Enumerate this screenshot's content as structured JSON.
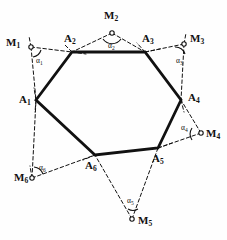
{
  "figure": {
    "type": "geometry-diagram",
    "background_color": "#fefefe",
    "ink_color": "#111111",
    "hexagon": {
      "stroke_width": 2.6,
      "style": "solid",
      "vertices": [
        {
          "label": "A",
          "sub": "1",
          "x": 36,
          "y": 100
        },
        {
          "label": "A",
          "sub": "2",
          "x": 72,
          "y": 52
        },
        {
          "label": "A",
          "sub": "3",
          "x": 145,
          "y": 52
        },
        {
          "label": "A",
          "sub": "4",
          "x": 181,
          "y": 100
        },
        {
          "label": "A",
          "sub": "5",
          "x": 158,
          "y": 148
        },
        {
          "label": "A",
          "sub": "6",
          "x": 95,
          "y": 155
        }
      ]
    },
    "external_points": [
      {
        "label": "M",
        "sub": "1",
        "x": 26,
        "y": 45
      },
      {
        "label": "M",
        "sub": "2",
        "x": 112,
        "y": 33
      },
      {
        "label": "M",
        "sub": "3",
        "x": 188,
        "y": 43
      },
      {
        "label": "M",
        "sub": "4",
        "x": 205,
        "y": 134
      },
      {
        "label": "M",
        "sub": "5",
        "x": 136,
        "y": 221
      },
      {
        "label": "M",
        "sub": "6",
        "x": 32,
        "y": 178
      }
    ],
    "angles": [
      {
        "label": "α",
        "sub": "1",
        "at": "M1"
      },
      {
        "label": "α",
        "sub": "2",
        "at": "M2"
      },
      {
        "label": "α",
        "sub": "3",
        "at": "M3"
      },
      {
        "label": "α",
        "sub": "4",
        "at": "M4"
      },
      {
        "label": "α",
        "sub": "5",
        "at": "M5"
      },
      {
        "label": "α",
        "sub": "6",
        "at": "M6"
      }
    ],
    "dashed_segments": [
      [
        "M1",
        "A1"
      ],
      [
        "M1",
        "A2"
      ],
      [
        "M2",
        "A2"
      ],
      [
        "M2",
        "A3"
      ],
      [
        "M3",
        "A3"
      ],
      [
        "M3",
        "A4"
      ],
      [
        "M4",
        "A4"
      ],
      [
        "M4",
        "A5"
      ],
      [
        "M5",
        "A5"
      ],
      [
        "M5",
        "A6"
      ],
      [
        "M6",
        "A6"
      ],
      [
        "M6",
        "A1"
      ]
    ],
    "point_labels": {
      "a1": "A",
      "a1s": "1",
      "a2": "A",
      "a2s": "2",
      "a3": "A",
      "a3s": "3",
      "a4": "A",
      "a4s": "4",
      "a5": "A",
      "a5s": "5",
      "a6": "A",
      "a6s": "6",
      "m1": "M",
      "m1s": "1",
      "m2": "M",
      "m2s": "2",
      "m3": "M",
      "m3s": "3",
      "m4": "M",
      "m4s": "4",
      "m5": "M",
      "m5s": "5",
      "m6": "M",
      "m6s": "6",
      "alpha": "α",
      "al1": "1",
      "al2": "2",
      "al3": "3",
      "al4": "4",
      "al5": "5",
      "al6": "6"
    }
  }
}
